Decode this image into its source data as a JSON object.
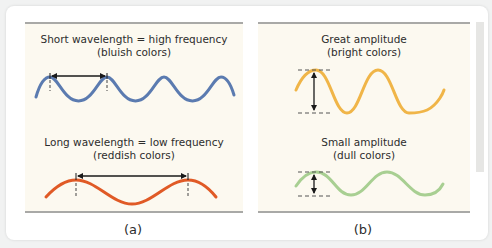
{
  "panels": [
    {
      "label": "(a)",
      "sections": [
        {
          "title": "Short wavelength = high frequency",
          "subtitle": "(bluish colors)",
          "wave_color": "#5b7bb0",
          "measure": "wavelength"
        },
        {
          "title": "Long wavelength = low frequency",
          "subtitle": "(reddish colors)",
          "wave_color": "#e05a26",
          "measure": "wavelength"
        }
      ]
    },
    {
      "label": "(b)",
      "sections": [
        {
          "title": "Great amplitude",
          "subtitle": "(bright colors)",
          "wave_color": "#f0b548",
          "measure": "amplitude"
        },
        {
          "title": "Small amplitude",
          "subtitle": "(dull colors)",
          "wave_color": "#a8cf92",
          "measure": "amplitude"
        }
      ]
    }
  ],
  "colors": {
    "panel_background": "#fcf9f0",
    "rule": "#a9a9a7",
    "arrow": "#1a1a1a"
  }
}
